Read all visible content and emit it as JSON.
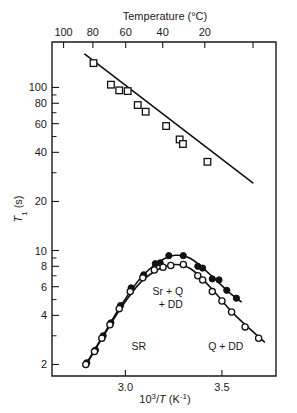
{
  "chart_data": {
    "type": "scatter",
    "title": "",
    "xlabel": "10³/T (K⁻¹)",
    "ylabel": "T₁ (s)",
    "top_axis_label": "Temperature (°C)",
    "yscale": "log",
    "xlim": [
      2.62,
      3.78
    ],
    "ylim": [
      1.7,
      190
    ],
    "grid": false,
    "legend_position": "none",
    "x_ticks": [
      3.0,
      3.5
    ],
    "x_tick_labels": [
      "3.0",
      "3.5"
    ],
    "y_ticks": [
      100,
      80,
      60,
      40,
      20,
      10,
      8,
      6,
      4,
      2
    ],
    "y_tick_labels": [
      "100",
      "80",
      "60",
      "40",
      "20",
      "10",
      "8",
      "6",
      "4",
      "2"
    ],
    "top_ticks": [
      100,
      80,
      60,
      40,
      20,
      0
    ],
    "top_tick_labels": [
      "100",
      "80",
      "60",
      "40",
      "20",
      ""
    ],
    "annotations": [
      {
        "text": "SR",
        "x": 3.07,
        "y": 2.45
      },
      {
        "text": "Sr + Q",
        "x": 3.22,
        "y": 5.3
      },
      {
        "text": "+ DD",
        "x": 3.235,
        "y": 4.45
      },
      {
        "text": "Q + DD",
        "x": 3.52,
        "y": 2.45
      }
    ],
    "series": [
      {
        "name": "upper-squares",
        "marker": "open-square",
        "fit_line": {
          "x": [
            2.79,
            3.66
          ],
          "y": [
            160,
            26
          ]
        },
        "points": [
          {
            "x": 2.835,
            "y": 141
          },
          {
            "x": 2.925,
            "y": 104
          },
          {
            "x": 2.968,
            "y": 96
          },
          {
            "x": 3.012,
            "y": 95
          },
          {
            "x": 3.064,
            "y": 78
          },
          {
            "x": 3.105,
            "y": 71
          },
          {
            "x": 3.211,
            "y": 58
          },
          {
            "x": 3.281,
            "y": 48
          },
          {
            "x": 3.298,
            "y": 45
          },
          {
            "x": 3.425,
            "y": 35
          }
        ]
      },
      {
        "name": "lower-filled-circles",
        "marker": "filled-circle",
        "points": [
          {
            "x": 2.8,
            "y": 2.05
          },
          {
            "x": 2.845,
            "y": 2.45
          },
          {
            "x": 2.885,
            "y": 3.0
          },
          {
            "x": 2.925,
            "y": 3.6
          },
          {
            "x": 2.975,
            "y": 4.6
          },
          {
            "x": 3.03,
            "y": 5.9
          },
          {
            "x": 3.095,
            "y": 7.1
          },
          {
            "x": 3.155,
            "y": 8.3
          },
          {
            "x": 3.18,
            "y": 8.4
          },
          {
            "x": 3.225,
            "y": 9.3
          },
          {
            "x": 3.3,
            "y": 9.3
          },
          {
            "x": 3.375,
            "y": 8.0
          },
          {
            "x": 3.4,
            "y": 7.8
          },
          {
            "x": 3.45,
            "y": 6.7
          },
          {
            "x": 3.485,
            "y": 6.6
          },
          {
            "x": 3.525,
            "y": 5.7
          },
          {
            "x": 3.575,
            "y": 5.1
          }
        ],
        "curve": [
          {
            "x": 2.79,
            "y": 1.95
          },
          {
            "x": 2.88,
            "y": 2.95
          },
          {
            "x": 2.98,
            "y": 4.65
          },
          {
            "x": 3.08,
            "y": 6.8
          },
          {
            "x": 3.18,
            "y": 8.6
          },
          {
            "x": 3.26,
            "y": 9.35
          },
          {
            "x": 3.34,
            "y": 8.9
          },
          {
            "x": 3.44,
            "y": 7.1
          },
          {
            "x": 3.54,
            "y": 5.5
          },
          {
            "x": 3.6,
            "y": 4.85
          }
        ]
      },
      {
        "name": "lower-open-circles",
        "marker": "open-circle",
        "points": [
          {
            "x": 2.795,
            "y": 2.0
          },
          {
            "x": 2.84,
            "y": 2.4
          },
          {
            "x": 2.878,
            "y": 2.9
          },
          {
            "x": 2.92,
            "y": 3.5
          },
          {
            "x": 2.968,
            "y": 4.4
          },
          {
            "x": 3.025,
            "y": 5.6
          },
          {
            "x": 3.09,
            "y": 6.8
          },
          {
            "x": 3.15,
            "y": 7.6
          },
          {
            "x": 3.195,
            "y": 7.9
          },
          {
            "x": 3.235,
            "y": 8.1
          },
          {
            "x": 3.3,
            "y": 8.2
          },
          {
            "x": 3.375,
            "y": 7.0
          },
          {
            "x": 3.4,
            "y": 6.6
          },
          {
            "x": 3.45,
            "y": 5.6
          },
          {
            "x": 3.5,
            "y": 4.9
          },
          {
            "x": 3.55,
            "y": 4.2
          },
          {
            "x": 3.62,
            "y": 3.4
          },
          {
            "x": 3.69,
            "y": 2.9
          }
        ],
        "curve": [
          {
            "x": 2.79,
            "y": 1.93
          },
          {
            "x": 2.88,
            "y": 2.9
          },
          {
            "x": 2.98,
            "y": 4.5
          },
          {
            "x": 3.08,
            "y": 6.4
          },
          {
            "x": 3.18,
            "y": 7.75
          },
          {
            "x": 3.26,
            "y": 8.2
          },
          {
            "x": 3.34,
            "y": 7.7
          },
          {
            "x": 3.44,
            "y": 5.95
          },
          {
            "x": 3.56,
            "y": 4.1
          },
          {
            "x": 3.72,
            "y": 2.75
          }
        ]
      }
    ]
  }
}
